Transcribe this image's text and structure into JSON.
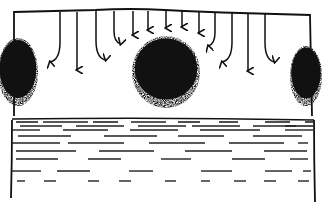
{
  "diagram": {
    "description": "Line drawing of a container: a top surface with downward arrows (falling flow) passing between three dark stippled blobs, above a body of water drawn with horizontal dash lines.",
    "colors": {
      "ink": "#111111",
      "background": "#ffffff"
    },
    "arrows": [
      {
        "x": 60,
        "top": 12,
        "bottom": 62,
        "curve": "left"
      },
      {
        "x": 77,
        "top": 12,
        "bottom": 70,
        "curve": "none"
      },
      {
        "x": 96,
        "top": 11,
        "bottom": 60,
        "curve": "right"
      },
      {
        "x": 114,
        "top": 11,
        "bottom": 44,
        "curve": "right"
      },
      {
        "x": 133,
        "top": 11,
        "bottom": 35,
        "curve": "none"
      },
      {
        "x": 148,
        "top": 11,
        "bottom": 30,
        "curve": "none"
      },
      {
        "x": 166,
        "top": 11,
        "bottom": 28,
        "curve": "none"
      },
      {
        "x": 182,
        "top": 11,
        "bottom": 27,
        "curve": "none"
      },
      {
        "x": 199,
        "top": 12,
        "bottom": 33,
        "curve": "none"
      },
      {
        "x": 215,
        "top": 12,
        "bottom": 46,
        "curve": "left"
      },
      {
        "x": 232,
        "top": 12,
        "bottom": 62,
        "curve": "left"
      },
      {
        "x": 248,
        "top": 13,
        "bottom": 71,
        "curve": "none"
      },
      {
        "x": 265,
        "top": 13,
        "bottom": 62,
        "curve": "right"
      }
    ],
    "blobs": [
      {
        "name": "left-blob",
        "cx": 18,
        "cy": 72,
        "rx": 20,
        "ry": 34
      },
      {
        "name": "center-blob",
        "cx": 166,
        "cy": 72,
        "rx": 34,
        "ry": 36
      },
      {
        "name": "right-blob",
        "cx": 306,
        "cy": 76,
        "rx": 16,
        "ry": 30
      }
    ],
    "water_surface_y": 128,
    "water_rows": [
      [
        [
          16,
          38
        ],
        [
          43,
          88
        ],
        [
          93,
          118
        ],
        [
          131,
          166
        ],
        [
          178,
          200
        ],
        [
          219,
          238
        ],
        [
          265,
          290
        ],
        [
          305,
          314
        ]
      ],
      [
        [
          20,
          62
        ],
        [
          76,
          124
        ],
        [
          138,
          186
        ],
        [
          192,
          240
        ],
        [
          253,
          296
        ],
        [
          285,
          313
        ]
      ],
      [
        [
          12,
          40
        ],
        [
          63,
          108
        ],
        [
          130,
          178
        ],
        [
          200,
          260
        ],
        [
          285,
          313
        ]
      ],
      [
        [
          18,
          71
        ],
        [
          104,
          157
        ],
        [
          178,
          224
        ],
        [
          253,
          302
        ]
      ],
      [
        [
          12,
          60
        ],
        [
          68,
          124
        ],
        [
          149,
          205
        ],
        [
          229,
          284
        ],
        [
          298,
          308
        ]
      ],
      [
        [
          16,
          76
        ],
        [
          99,
          154
        ],
        [
          185,
          232
        ],
        [
          264,
          307
        ]
      ],
      [
        [
          16,
          58
        ],
        [
          88,
          121
        ],
        [
          161,
          191
        ],
        [
          232,
          265
        ],
        [
          290,
          308
        ]
      ],
      [
        [
          12,
          41
        ],
        [
          57,
          90
        ],
        [
          129,
          153
        ],
        [
          201,
          232
        ],
        [
          265,
          292
        ],
        [
          303,
          311
        ]
      ],
      [
        [
          17,
          25
        ],
        [
          44,
          56
        ],
        [
          88,
          99
        ],
        [
          119,
          131
        ],
        [
          165,
          176
        ],
        [
          201,
          210
        ],
        [
          234,
          246
        ],
        [
          264,
          276
        ],
        [
          298,
          309
        ]
      ]
    ],
    "water_row_y": [
      122,
      126,
      130,
      136,
      143,
      151,
      159,
      171,
      181
    ]
  }
}
